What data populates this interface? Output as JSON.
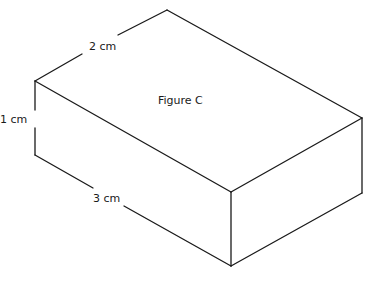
{
  "figure": {
    "title": "Figure C",
    "shape": "rectangular-prism",
    "dimensions": {
      "width_label": "2 cm",
      "height_label": "1 cm",
      "length_label": "3 cm"
    },
    "colors": {
      "stroke": "#1a1a1a",
      "background": "#ffffff"
    }
  }
}
